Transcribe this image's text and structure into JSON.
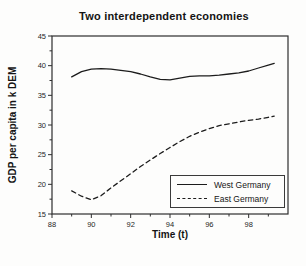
{
  "chart_data": {
    "type": "line",
    "title": "Two interdependent economies",
    "xlabel": "Time (t)",
    "ylabel": "GDP per capita in k DEM",
    "xlim": [
      88,
      100
    ],
    "ylim": [
      15,
      45
    ],
    "x_ticks": [
      88,
      90,
      92,
      94,
      96,
      98
    ],
    "x_minor_ticks": [
      89,
      91,
      93,
      95,
      97,
      99
    ],
    "y_ticks": [
      15,
      20,
      25,
      30,
      35,
      40,
      45
    ],
    "y_minor_ticks": [
      17.5,
      22.5,
      27.5,
      32.5,
      37.5,
      42.5
    ],
    "grid": "off",
    "legend_position": "lower right",
    "x": [
      89,
      89.5,
      90,
      90.5,
      91,
      91.5,
      92,
      92.5,
      93,
      93.5,
      94,
      94.5,
      95,
      95.5,
      96,
      96.5,
      97,
      97.5,
      98,
      98.5,
      99,
      99.3
    ],
    "series": [
      {
        "name": "West Germany",
        "line_style": "solid",
        "color": "#1c1c1c",
        "values": [
          38.1,
          39.0,
          39.4,
          39.5,
          39.4,
          39.2,
          39.0,
          38.6,
          38.1,
          37.7,
          37.6,
          37.9,
          38.2,
          38.3,
          38.3,
          38.4,
          38.6,
          38.8,
          39.1,
          39.6,
          40.1,
          40.4
        ]
      },
      {
        "name": "East Germany",
        "line_style": "dashed",
        "color": "#1c1c1c",
        "values": [
          18.9,
          18.0,
          17.4,
          18.1,
          19.4,
          20.6,
          21.8,
          23.0,
          24.1,
          25.2,
          26.2,
          27.2,
          28.1,
          28.8,
          29.4,
          29.9,
          30.2,
          30.5,
          30.8,
          31.0,
          31.3,
          31.5
        ]
      }
    ],
    "frame_color": "#2e2e2e",
    "tick_label_color": "#1f1f1f"
  },
  "legend": {
    "entries": [
      {
        "label": "West Germany",
        "line_style": "solid"
      },
      {
        "label": "East Germany",
        "line_style": "dashed"
      }
    ]
  }
}
